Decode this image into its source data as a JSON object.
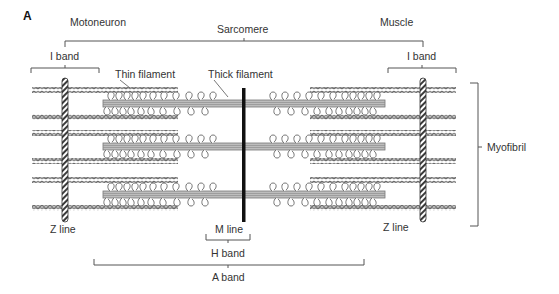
{
  "figure": {
    "panel_label": "A",
    "title_labels": {
      "motoneuron": "Motoneuron",
      "muscle": "Muscle",
      "sarcomere": "Sarcomere"
    },
    "labels": {
      "i_band_left": "I band",
      "i_band_right": "I band",
      "thin_filament": "Thin filament",
      "thick_filament": "Thick filament",
      "myofibril": "Myofibril",
      "z_line_left": "Z line",
      "z_line_right": "Z line",
      "m_line": "M line",
      "h_band": "H band",
      "a_band": "A band"
    },
    "colors": {
      "line": "#555555",
      "thin_filament": "#777777",
      "z_line": "#444444",
      "m_line": "#111111",
      "text": "#333333"
    },
    "structure": {
      "thin_filament_rows_y": [
        90,
        117,
        133,
        161,
        180,
        208
      ],
      "thick_filament_rows_y": [
        103,
        146,
        194
      ]
    }
  }
}
